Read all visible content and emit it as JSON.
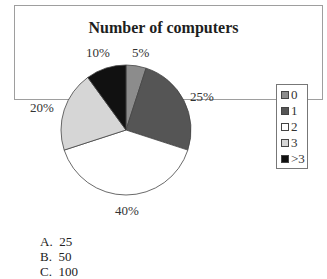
{
  "chart_data": {
    "type": "pie",
    "title": "Number of computers",
    "categories": [
      "0",
      "1",
      "2",
      "3",
      ">3"
    ],
    "values": [
      5,
      25,
      40,
      20,
      10
    ],
    "labels": [
      "5%",
      "25%",
      "40%",
      "20%",
      "10%"
    ],
    "colors": [
      "#8c8c8c",
      "#555555",
      "#ffffff",
      "#d6d6d6",
      "#111111"
    ],
    "legend_position": "right"
  },
  "legend": {
    "items": [
      {
        "label": "0",
        "color": "#8c8c8c"
      },
      {
        "label": "1",
        "color": "#555555"
      },
      {
        "label": "2",
        "color": "#ffffff"
      },
      {
        "label": "3",
        "color": "#d6d6d6"
      },
      {
        "label": ">3",
        "color": "#111111"
      }
    ]
  },
  "answers": [
    {
      "letter": "A.",
      "value": "25"
    },
    {
      "letter": "B.",
      "value": "50"
    },
    {
      "letter": "C.",
      "value": "100"
    }
  ]
}
